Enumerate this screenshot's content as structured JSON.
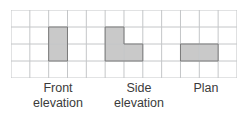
{
  "figure": {
    "background_color": "#ffffff"
  },
  "grid": {
    "columns": 12,
    "rows": 4,
    "cell_width": 18.83,
    "cell_height": 17.0,
    "line_color": "#c4c6c8",
    "line_width": 1,
    "origin_x": 11,
    "origin_y": 10,
    "width": 226,
    "height": 68
  },
  "shapes": {
    "fill_color": "#c9c9c9",
    "stroke_color": "#7a7a7a",
    "stroke_width": 1,
    "items": [
      {
        "name": "front-elevation-shape",
        "description": "vertical rectangle 1 cell wide by 2 cells tall",
        "cells": [
          {
            "col": 2,
            "row": 1
          },
          {
            "col": 2,
            "row": 2
          }
        ]
      },
      {
        "name": "side-elevation-shape",
        "description": "L-shape: 1 by 2 column plus one cell to its lower right",
        "cells": [
          {
            "col": 5,
            "row": 1
          },
          {
            "col": 5,
            "row": 2
          },
          {
            "col": 6,
            "row": 2
          }
        ]
      },
      {
        "name": "plan-shape",
        "description": "horizontal rectangle 2 cells wide by 1 cell tall",
        "cells": [
          {
            "col": 9,
            "row": 2
          },
          {
            "col": 10,
            "row": 2
          }
        ]
      }
    ]
  },
  "labels": {
    "front": "Front\nelevation",
    "side": "Side\nelevation",
    "plan": "Plan",
    "text_color": "#3b3b3b"
  }
}
